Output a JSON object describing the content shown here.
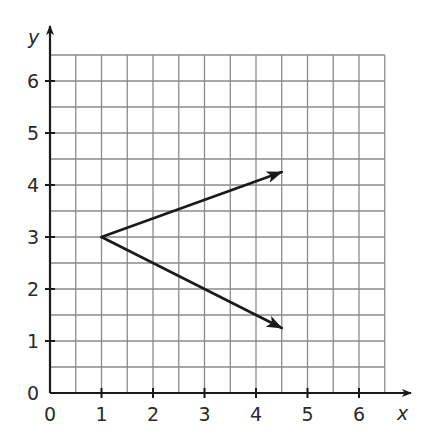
{
  "chart_data": {
    "type": "line",
    "title": "",
    "xlabel": "x",
    "ylabel": "y",
    "xlim": [
      0,
      6.5
    ],
    "ylim": [
      0,
      6.5
    ],
    "x_ticks": [
      0,
      1,
      2,
      3,
      4,
      5,
      6
    ],
    "y_ticks": [
      0,
      1,
      2,
      3,
      4,
      5,
      6
    ],
    "x_tick_labels": [
      "0",
      "1",
      "2",
      "3",
      "4",
      "5",
      "6"
    ],
    "y_tick_labels": [
      "0",
      "1",
      "2",
      "3",
      "4",
      "5",
      "6"
    ],
    "grid": true,
    "grid_step": 0.5,
    "legend": null,
    "series": [
      {
        "name": "upper-ray",
        "points": [
          [
            1,
            3
          ],
          [
            4.5,
            4.25
          ]
        ],
        "arrow_end": true
      },
      {
        "name": "lower-ray",
        "points": [
          [
            1,
            3
          ],
          [
            4.5,
            1.25
          ]
        ],
        "arrow_end": true
      }
    ],
    "colors": {
      "grid": "#8a8a8a",
      "axis": "#1a1a1a",
      "rays": "#1a1a1a",
      "text": "#2a2a2a"
    }
  }
}
